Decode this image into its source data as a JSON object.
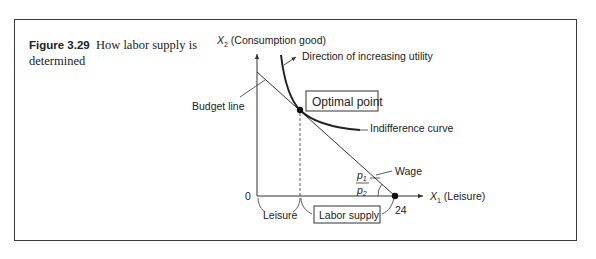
{
  "figure": {
    "number": "Figure 3.29",
    "title": "How labor supply is determined"
  },
  "axes": {
    "y_label_var": "X",
    "y_label_sub": "2",
    "y_label_text": " (Consumption good)",
    "x_label_var": "X",
    "x_label_sub": "1",
    "x_label_text": " (Leisure)",
    "origin": "0",
    "x_max_tick": "24"
  },
  "annotations": {
    "direction": "Direction of increasing utility",
    "budget_line": "Budget line",
    "optimal_point": "Optimal point",
    "indifference_curve": "Indifference curve",
    "wage": "Wage",
    "slope_numerator": "p",
    "slope_numerator_sub": "1",
    "slope_denominator": "p",
    "slope_denominator_sub": "2",
    "leisure": "Leisure",
    "labor_supply": "Labor supply"
  },
  "colors": {
    "line": "#333333",
    "frame": "#3a3a3a",
    "text": "#222222"
  }
}
